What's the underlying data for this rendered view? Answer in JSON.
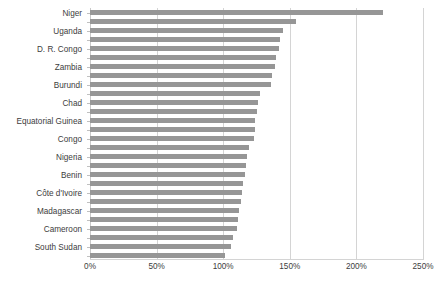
{
  "chart_data": {
    "type": "bar",
    "orientation": "horizontal",
    "title": "",
    "subtitle": "",
    "xlabel": "",
    "ylabel": "",
    "xlim": [
      0,
      250
    ],
    "xtick_labels": [
      "0%",
      "50%",
      "100%",
      "150%",
      "200%",
      "250%"
    ],
    "xtick_values": [
      0,
      50,
      100,
      150,
      200,
      250
    ],
    "xtick_step": 50,
    "grid": true,
    "legend": false,
    "legend_position": "none",
    "bar_color": "#969696",
    "gridline_color": "#d4d4d4",
    "text_color": "#3d3d3d",
    "label_interval": 2,
    "categories": [
      "Niger",
      "",
      "Uganda",
      "",
      "D. R. Congo",
      "",
      "Zambia",
      "",
      "Burundi",
      "",
      "Chad",
      "",
      "Equatorial Guinea",
      "",
      "Congo",
      "",
      "Nigeria",
      "",
      "Benin",
      "",
      "Côte d'Ivoire",
      "",
      "Madagascar",
      "",
      "Cameroon",
      "",
      "South Sudan",
      ""
    ],
    "labelled_categories": [
      "Niger",
      "Uganda",
      "D. R. Congo",
      "Zambia",
      "Burundi",
      "Chad",
      "Equatorial Guinea",
      "Congo",
      "Nigeria",
      "Benin",
      "Côte d'Ivoire",
      "Madagascar",
      "Cameroon",
      "South Sudan"
    ],
    "values": [
      220,
      155,
      145,
      143,
      142,
      140,
      139,
      137,
      136,
      128,
      126,
      125,
      124,
      124,
      123,
      119,
      118,
      117,
      116,
      115,
      114,
      113,
      112,
      111,
      110,
      107,
      106,
      101
    ],
    "value_unit": "%"
  }
}
